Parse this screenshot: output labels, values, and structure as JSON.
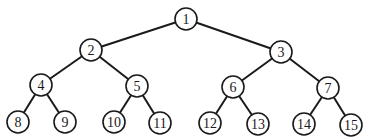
{
  "diagram": {
    "type": "binary-tree",
    "node_radius": 11,
    "colors": {
      "stroke": "#1a1a1a",
      "fill": "#ffffff",
      "text": "#1a1a1a"
    },
    "nodes": [
      {
        "id": 1,
        "label": "1",
        "x": 186,
        "y": 19
      },
      {
        "id": 2,
        "label": "2",
        "x": 91,
        "y": 50
      },
      {
        "id": 3,
        "label": "3",
        "x": 281,
        "y": 52
      },
      {
        "id": 4,
        "label": "4",
        "x": 41,
        "y": 85
      },
      {
        "id": 5,
        "label": "5",
        "x": 137,
        "y": 86
      },
      {
        "id": 6,
        "label": "6",
        "x": 233,
        "y": 87
      },
      {
        "id": 7,
        "label": "7",
        "x": 328,
        "y": 88
      },
      {
        "id": 8,
        "label": "8",
        "x": 18,
        "y": 122
      },
      {
        "id": 9,
        "label": "9",
        "x": 65,
        "y": 122
      },
      {
        "id": 10,
        "label": "10",
        "x": 114,
        "y": 122
      },
      {
        "id": 11,
        "label": "11",
        "x": 160,
        "y": 123
      },
      {
        "id": 12,
        "label": "12",
        "x": 210,
        "y": 123
      },
      {
        "id": 13,
        "label": "13",
        "x": 258,
        "y": 124
      },
      {
        "id": 14,
        "label": "14",
        "x": 304,
        "y": 124
      },
      {
        "id": 15,
        "label": "15",
        "x": 351,
        "y": 125
      }
    ],
    "edges": [
      {
        "from": 1,
        "to": 2
      },
      {
        "from": 1,
        "to": 3
      },
      {
        "from": 2,
        "to": 4
      },
      {
        "from": 2,
        "to": 5
      },
      {
        "from": 3,
        "to": 6
      },
      {
        "from": 3,
        "to": 7
      },
      {
        "from": 4,
        "to": 8
      },
      {
        "from": 4,
        "to": 9
      },
      {
        "from": 5,
        "to": 10
      },
      {
        "from": 5,
        "to": 11
      },
      {
        "from": 6,
        "to": 12
      },
      {
        "from": 6,
        "to": 13
      },
      {
        "from": 7,
        "to": 14
      },
      {
        "from": 7,
        "to": 15
      }
    ]
  }
}
